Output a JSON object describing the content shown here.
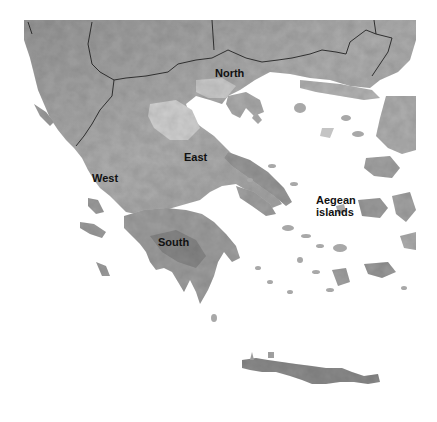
{
  "map": {
    "type": "grayscale-relief-map",
    "subject": "Greece",
    "colors": {
      "sea": "#ffffff",
      "land_light": "#d4d4d4",
      "land_mid": "#a8a8a8",
      "land_dark": "#6e6e6e",
      "border": "#222222",
      "label": "#111111"
    },
    "regions": [
      {
        "id": "north",
        "label": "North",
        "x": 215,
        "y": 67
      },
      {
        "id": "east",
        "label": "East",
        "x": 184,
        "y": 151
      },
      {
        "id": "west",
        "label": "West",
        "x": 92,
        "y": 172
      },
      {
        "id": "south",
        "label": "South",
        "x": 158,
        "y": 236
      },
      {
        "id": "aegean",
        "label": "Aegean\nislands",
        "x": 316,
        "y": 194
      }
    ]
  }
}
